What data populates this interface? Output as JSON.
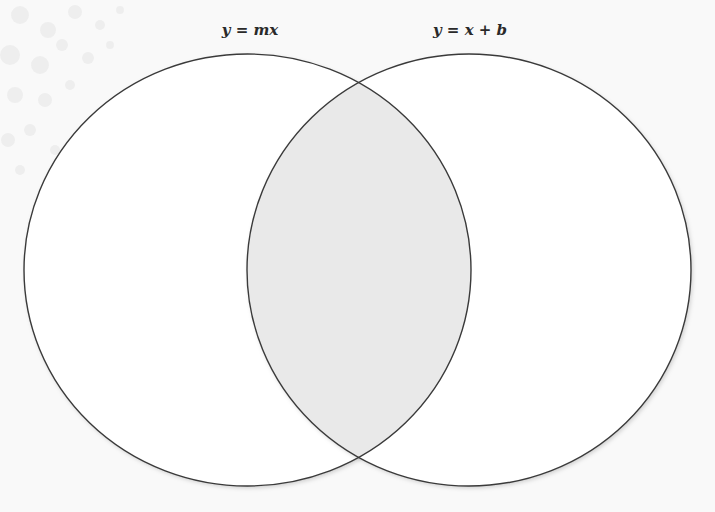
{
  "diagram": {
    "type": "venn",
    "sets": [
      {
        "id": "left",
        "label": "y = mx"
      },
      {
        "id": "right",
        "label": "y = x + b"
      }
    ],
    "intersection": {
      "label": ""
    },
    "colors": {
      "outline": "#3a3a3a",
      "set_fill": "#ffffff",
      "intersection_fill": "#e9e9e9",
      "background": "#f9f9f9",
      "label_text": "#2a2a2a"
    }
  },
  "top_cut_text": "· ·   · ·"
}
